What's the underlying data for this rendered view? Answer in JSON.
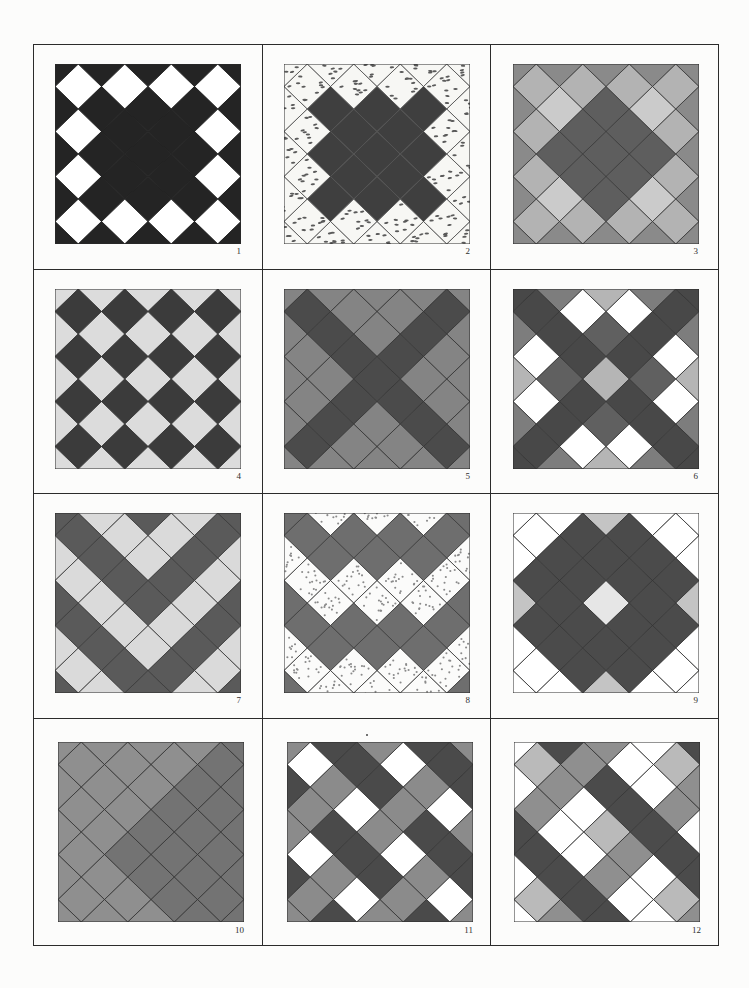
{
  "page": {
    "background": "#fcfcfb",
    "grid_line_color": "#2b2b2b"
  },
  "quilts": [
    {
      "label": "1",
      "line": "#1e1e1e",
      "palette": {
        "D": {
          "fill": "#242424"
        },
        "W": {
          "fill": "#ffffff"
        }
      },
      "rows": [
        "D.D.D.D.D",
        ".W.W.W.W.",
        "D.D.D.D.D",
        ".W.D.D.W.",
        "D.D.D.D.D",
        ".W.D.D.W.",
        "D.D.D.D.D",
        ".W.W.W.W.",
        "D.D.D.D.D"
      ]
    },
    {
      "label": "2",
      "line": "#505050",
      "palette": {
        "K": {
          "fill": "#3f3f3f"
        },
        "S": {
          "fill": "#f7f7f4",
          "speck": "dash",
          "speckColor": "#5a5a5a"
        }
      },
      "rows": [
        "S.S.S.S.S",
        ".S.S.S.S.",
        "S.K.K.K.S",
        ".S.K.K.S.",
        "S.K.K.K.S",
        ".S.K.K.S.",
        "S.K.K.K.S",
        ".S.S.S.S.",
        "S.S.S.S.S"
      ]
    },
    {
      "label": "3",
      "line": "#3a3a3a",
      "palette": {
        "M": {
          "fill": "#8a8a8a"
        },
        "L": {
          "fill": "#b3b3b3"
        },
        "P": {
          "fill": "#cbcbcb"
        },
        "K": {
          "fill": "#5e5e5e"
        }
      },
      "rows": [
        "M.M.M.M.M",
        ".L.L.L.L.",
        "M.P.K.P.M",
        ".L.K.K.L.",
        "M.K.K.K.M",
        ".L.K.K.L.",
        "M.P.K.P.M",
        ".L.L.L.L.",
        "M.M.M.M.M"
      ]
    },
    {
      "label": "4",
      "line": "#333333",
      "palette": {
        "K": {
          "fill": "#3b3b3b"
        },
        "P": {
          "fill": "#dcdcdc"
        }
      },
      "rows": [
        "P.P.P.P.P",
        ".K.K.K.K.",
        "P.P.P.P.P",
        ".K.K.K.K.",
        "P.P.P.P.P",
        ".K.K.K.K.",
        "P.P.P.P.P",
        ".K.K.K.K.",
        "P.P.P.P.P"
      ]
    },
    {
      "label": "5",
      "line": "#343434",
      "palette": {
        "M": {
          "fill": "#848484"
        },
        "K": {
          "fill": "#4b4b4b"
        }
      },
      "rows": [
        "M.M.M.M.M",
        ".K.M.M.K.",
        "M.K.M.K.M",
        ".M.K.K.M.",
        "M.M.K.M.M",
        ".M.K.K.M.",
        "M.K.M.K.M",
        ".K.M.M.K.",
        "M.M.M.M.M"
      ]
    },
    {
      "label": "6",
      "line": "#333333",
      "palette": {
        "K": {
          "fill": "#484848"
        },
        "G": {
          "fill": "#606060"
        },
        "M": {
          "fill": "#7d7d7d"
        },
        "L": {
          "fill": "#b5b5b5"
        },
        "W": {
          "fill": "#ffffff"
        }
      },
      "rows": [
        "K.M.L.M.K",
        ".K.W.W.K.",
        "M.K.G.K.M",
        ".W.K.K.W.",
        "L.G.L.G.L",
        ".W.K.K.W.",
        "M.K.G.K.M",
        ".K.W.W.K.",
        "K.M.L.M.K"
      ]
    },
    {
      "label": "7",
      "line": "#3a3a3a",
      "palette": {
        "K": {
          "fill": "#5a5a5a"
        },
        "P": {
          "fill": "#dadada"
        }
      },
      "rows": [
        "K.P.K.P.K",
        ".K.P.P.K.",
        "P.K.P.K.P",
        ".P.K.K.P.",
        "K.P.K.P.K",
        ".K.P.P.K.",
        "P.K.P.K.P",
        ".P.K.K.P.",
        "K.P.K.P.K"
      ]
    },
    {
      "label": "8",
      "line": "#3c3c3c",
      "palette": {
        "K": {
          "fill": "#6e6e6e"
        },
        "S": {
          "fill": "#fbfbfa",
          "speck": "dot",
          "speckColor": "#8a8a8a"
        }
      },
      "rows": [
        "K.S.S.S.K",
        ".K.K.K.K.",
        "S.K.K.K.S",
        ".S.S.S.S.",
        "K.S.S.S.K",
        ".K.K.K.K.",
        "S.K.K.K.S",
        ".S.S.S.S.",
        "K.S.S.S.K"
      ]
    },
    {
      "label": "9",
      "line": "#333333",
      "palette": {
        "K": {
          "fill": "#4b4b4b"
        },
        "W": {
          "fill": "#ffffff"
        },
        "L": {
          "fill": "#c4c4c4"
        },
        "P": {
          "fill": "#e6e6e6"
        }
      },
      "rows": [
        "W.W.L.W.W",
        ".W.K.K.W.",
        "W.K.K.K.W",
        ".K.K.K.K.",
        "L.K.P.K.L",
        ".K.K.K.K.",
        "W.K.K.K.W",
        ".W.K.K.W.",
        "W.W.L.W.W"
      ]
    },
    {
      "label": "10",
      "line": "#333333",
      "palette": {
        "M": {
          "fill": "#8f8f8f"
        },
        "K": {
          "fill": "#737373"
        }
      },
      "rows": [
        "M.M.M.M.K",
        ".M.M.M.K.",
        "M.M.M.K.K",
        ".M.M.K.K.",
        "M.M.K.K.K",
        ".M.K.K.K.",
        "M.M.K.K.K",
        ".M.M.K.K.",
        "M.M.M.K.K"
      ]
    },
    {
      "label": "11",
      "line": "#333333",
      "palette": {
        "K": {
          "fill": "#4a4a4a"
        },
        "M": {
          "fill": "#8b8b8b"
        },
        "W": {
          "fill": "#ffffff"
        }
      },
      "rows": [
        "M.K.M.K.M",
        ".W.K.W.K.",
        "K.M.K.M.K",
        ".M.W.M.W.",
        "M.K.M.K.M",
        ".W.K.W.K.",
        "K.M.K.M.K",
        ".M.W.M.W.",
        "M.K.M.K.M"
      ]
    },
    {
      "label": "12",
      "line": "#333333",
      "palette": {
        "K": {
          "fill": "#4b4b4b"
        },
        "M": {
          "fill": "#8f8f8f"
        },
        "L": {
          "fill": "#bababa"
        },
        "W": {
          "fill": "#ffffff"
        }
      },
      "rows": [
        "W.K.M.W.K",
        ".L.M.W.L.",
        "W.M.K.W.M",
        ".M.W.K.M.",
        "K.W.L.K.W",
        ".K.W.M.K.",
        "W.K.M.W.K",
        ".L.K.W.L.",
        "W.M.K.W.M"
      ]
    }
  ]
}
